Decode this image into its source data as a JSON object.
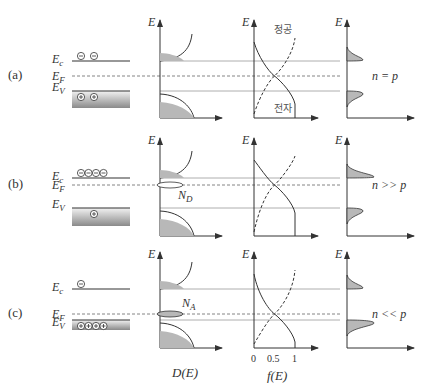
{
  "rows": [
    {
      "id": "a",
      "label": "(a)",
      "band": {
        "ec": "E",
        "ec_sub": "c",
        "ef": "E",
        "ef_sub": "F",
        "ev": "E",
        "ev_sub": "V",
        "electrons": 2,
        "holes": 2,
        "y_ec": 61,
        "y_ef": 76,
        "y_ev": 91
      },
      "dos": {
        "axis": "E",
        "dopant": ""
      },
      "fermi": {
        "axis": "E",
        "hole_label": "정공",
        "electron_label": "전자"
      },
      "carrier": {
        "axis": "E",
        "relation": "n = p"
      }
    },
    {
      "id": "b",
      "label": "(b)",
      "band": {
        "ec": "E",
        "ec_sub": "c",
        "ef": "E",
        "ef_sub": "F",
        "ev": "E",
        "ev_sub": "V",
        "electrons": 4,
        "holes": 1,
        "y_ec": 178,
        "y_ef": 185,
        "y_ev": 208
      },
      "dos": {
        "axis": "E",
        "dopant": "N",
        "dopant_sub": "D"
      },
      "fermi": {
        "axis": "E"
      },
      "carrier": {
        "axis": "E",
        "relation": "n >> p"
      }
    },
    {
      "id": "c",
      "label": "(c)",
      "band": {
        "ec": "E",
        "ec_sub": "c",
        "ef": "E",
        "ef_sub": "F",
        "ev": "E",
        "ev_sub": "V",
        "electrons": 1,
        "holes": 4,
        "y_ec": 289,
        "y_ef": 314,
        "y_ev": 320
      },
      "dos": {
        "axis": "E",
        "dopant": "N",
        "dopant_sub": "A"
      },
      "fermi": {
        "axis": "E"
      },
      "carrier": {
        "axis": "E",
        "relation": "n << p"
      }
    }
  ],
  "x_labels": {
    "dos": "D(E)",
    "fermi": "f(E)",
    "fermi_ticks": [
      "0",
      "0.5",
      "1"
    ]
  },
  "colors": {
    "line": "#333333",
    "fill": "#b8b8b8",
    "level_line": "#999999",
    "band_top": "#ffffff",
    "band_bottom": "#8c8c8c"
  }
}
